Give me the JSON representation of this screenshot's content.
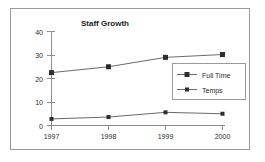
{
  "chart_data": {
    "type": "line",
    "title": "Staff Growth",
    "xlabel": "",
    "ylabel": "",
    "categories": [
      "1997",
      "1998",
      "1999",
      "2000"
    ],
    "x": [
      "1997",
      "1998",
      "1999",
      "2000"
    ],
    "series": [
      {
        "name": "Full Time",
        "values": [
          22.5,
          25.0,
          29.0,
          30.2
        ],
        "marker": "square",
        "color": "#2e2e2e"
      },
      {
        "name": "Temps",
        "values": [
          2.8,
          3.6,
          5.6,
          5.0
        ],
        "marker": "square",
        "color": "#2e2e2e"
      }
    ],
    "ylim": [
      0,
      40
    ],
    "yticks": [
      0,
      10,
      20,
      30,
      40
    ],
    "ytick_labels": [
      "0",
      "10",
      "20",
      "30",
      "40"
    ],
    "xtick_labels": [
      "1997",
      "1998",
      "1999",
      "2000"
    ],
    "grid": false,
    "legend_position": "center-right",
    "line_color": "#6b6b6b",
    "axis_color": "#8e8e8e",
    "background": "#ffffff",
    "border_color": "#9a9a9a"
  },
  "legend": {
    "entries": [
      {
        "label": "Full Time"
      },
      {
        "label": "Temps"
      }
    ]
  },
  "axes": {
    "y_tick_0": "0",
    "y_tick_1": "10",
    "y_tick_2": "20",
    "y_tick_3": "30",
    "y_tick_4": "40",
    "x_tick_0": "1997",
    "x_tick_1": "1998",
    "x_tick_2": "1999",
    "x_tick_3": "2000"
  }
}
